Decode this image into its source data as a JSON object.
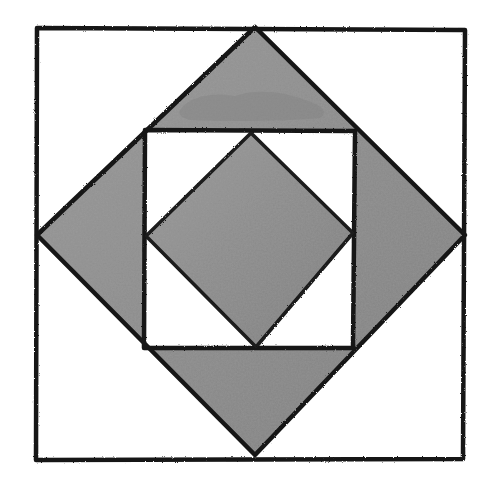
{
  "diagram": {
    "style": "hand-drawn ink with gray watercolor wash",
    "colors": {
      "background": "#ffffff",
      "ink": "#151515",
      "wash": "#8c8c8c",
      "wash_light": "#a3a3a3",
      "wash_dark": "#7a7a7a"
    },
    "shapes": {
      "outer_square": {
        "points": "37,28 465,30 463,459 36,460",
        "fill": "none"
      },
      "outer_diamond": {
        "points": "255,27 465,235 255,455 37,235",
        "fill": "wash"
      },
      "inner_square": {
        "points": "145,130 355,131 353,348 144,348",
        "fill": "none"
      },
      "inner_diamond": {
        "points": "251,133 353,233 256,347 146,236",
        "fill": "wash"
      }
    },
    "regions": [
      {
        "name": "top-triangle",
        "shaded": true
      },
      {
        "name": "right-triangle",
        "shaded": true
      },
      {
        "name": "bottom-triangle",
        "shaded": true
      },
      {
        "name": "left-triangle",
        "shaded": true
      },
      {
        "name": "center-diamond",
        "shaded": true
      },
      {
        "name": "inner-corner-triangles",
        "shaded": false,
        "count": 4
      },
      {
        "name": "outer-corner-triangles",
        "shaded": false,
        "count": 4
      }
    ]
  }
}
